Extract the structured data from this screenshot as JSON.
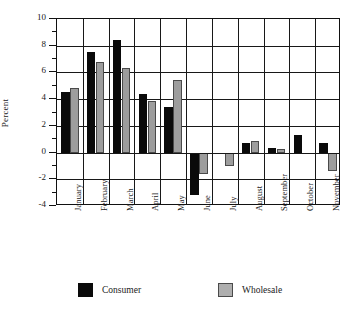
{
  "chart_data": {
    "type": "bar",
    "title": "",
    "xlabel": "",
    "ylabel": "Percent",
    "ylim": [
      -4,
      10
    ],
    "ytick_step": 2,
    "yminor_step": 1,
    "grid": true,
    "legend_position": "bottom",
    "ytick_labels": [
      "10",
      "8",
      "6",
      "4",
      "2",
      "0",
      "-2",
      "-4"
    ],
    "ytick_values": [
      10,
      8,
      6,
      4,
      2,
      0,
      -2,
      -4
    ],
    "categories": [
      "January",
      "February",
      "March",
      "April",
      "May",
      "June",
      "July",
      "August",
      "September",
      "October",
      "November"
    ],
    "series": [
      {
        "name": "Consumer",
        "color": "#0a0a0a",
        "values": [
          4.5,
          7.5,
          8.4,
          4.4,
          3.4,
          -3.2,
          0.0,
          0.7,
          0.35,
          1.3,
          0.7
        ]
      },
      {
        "name": "Wholesale",
        "color": "#9d9d9d",
        "values": [
          4.8,
          6.8,
          6.3,
          3.85,
          5.4,
          -1.6,
          -1.0,
          0.9,
          0.25,
          0.0,
          -1.4
        ]
      }
    ]
  },
  "legend": {
    "entries": [
      {
        "label": "Consumer",
        "swatch": "consumer"
      },
      {
        "label": "Wholesale",
        "swatch": "wholesale"
      }
    ]
  }
}
